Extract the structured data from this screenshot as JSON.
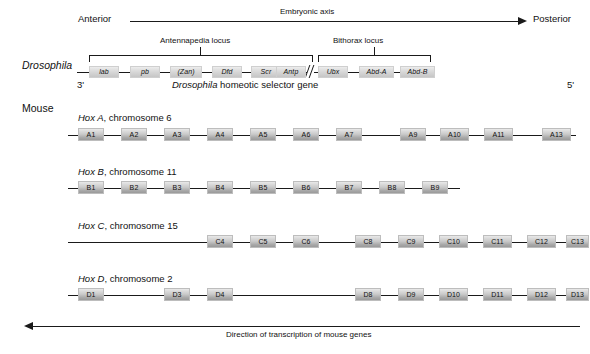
{
  "figure": {
    "embryonic_axis": {
      "label": "Embryonic axis",
      "left_label": "Anterior",
      "right_label": "Posterior"
    },
    "bottom_axis": {
      "label": "Direction of transcription of mouse genes"
    },
    "drosophila": {
      "organism_label": "Drosophila",
      "caption_italic": "Drosophila",
      "caption_rest": " homeotic selector gene",
      "end_left": "3'",
      "end_right": "5'",
      "loci": [
        {
          "label": "Antennapedia locus"
        },
        {
          "label": "Bithorax locus"
        }
      ],
      "genes_left": [
        {
          "label": "lab"
        },
        {
          "label": "pb"
        },
        {
          "label": "(Zan)"
        },
        {
          "label": "Dfd"
        },
        {
          "label": "Scr"
        },
        {
          "label": "Antp"
        }
      ],
      "genes_right": [
        {
          "label": "Ubx"
        },
        {
          "label": "Abd-A"
        },
        {
          "label": "Abd-B"
        }
      ]
    },
    "mouse": {
      "organism_label": "Mouse",
      "clusters": [
        {
          "name_italic": "Hox A",
          "name_rest": ", chromosome 6",
          "genes": [
            "A1",
            "A2",
            "A3",
            "A4",
            "A5",
            "A6",
            "A7",
            "A9",
            "A10",
            "A11",
            "A13"
          ]
        },
        {
          "name_italic": "Hox B",
          "name_rest": ", chromosome 11",
          "genes": [
            "B1",
            "B2",
            "B3",
            "B4",
            "B5",
            "B6",
            "B7",
            "B8",
            "B9"
          ]
        },
        {
          "name_italic": "Hox C",
          "name_rest": ", chromosome 15",
          "genes": [
            "C4",
            "C5",
            "C6",
            "C8",
            "C9",
            "C10",
            "C11",
            "C12",
            "C13"
          ]
        },
        {
          "name_italic": "Hox D",
          "name_rest": ", chromosome 2",
          "genes": [
            "D1",
            "D3",
            "D4",
            "D8",
            "D9",
            "D10",
            "D11",
            "D12",
            "D13"
          ]
        }
      ]
    },
    "colors": {
      "line": "#1a1a1a",
      "gene_fill_top": "#e9e9e9",
      "gene_fill_bottom": "#9a9a9a",
      "background": "#ffffff"
    }
  }
}
